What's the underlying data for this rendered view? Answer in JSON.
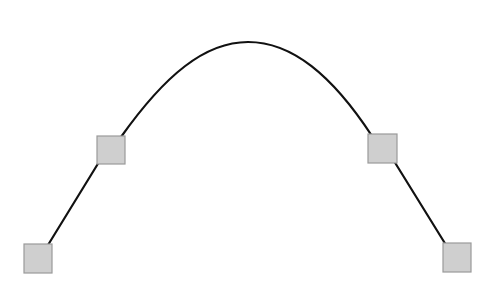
{
  "diagram": {
    "type": "curve-with-control-points",
    "background": "#ffffff",
    "stroke_color": "#111111",
    "node_fill": "#cfcfcf",
    "node_stroke": "#9a9a9a",
    "nodes": [
      {
        "id": "p1",
        "x": 24,
        "y": 244,
        "w": 28,
        "h": 29
      },
      {
        "id": "p2",
        "x": 97,
        "y": 136,
        "w": 28,
        "h": 28
      },
      {
        "id": "p3",
        "x": 368,
        "y": 134,
        "w": 29,
        "h": 29
      },
      {
        "id": "p4",
        "x": 443,
        "y": 243,
        "w": 28,
        "h": 29
      }
    ],
    "segments": [
      {
        "id": "s1",
        "d": "M 48 245 L 99 162"
      },
      {
        "id": "arc",
        "d": "M 121 137 C 165 75, 205 42, 248 42 C 292 42, 332 75, 372 136"
      },
      {
        "id": "s2",
        "d": "M 394 161 L 446 245"
      }
    ]
  }
}
